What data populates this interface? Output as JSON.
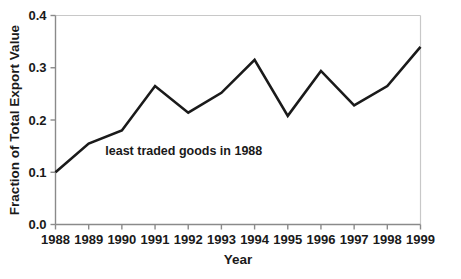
{
  "chart_data": {
    "type": "line",
    "title": "",
    "xlabel": "Year",
    "ylabel": "Fraction of Total Export Value",
    "categories": [
      "1988",
      "1989",
      "1990",
      "1991",
      "1992",
      "1993",
      "1994",
      "1995",
      "1996",
      "1997",
      "1998",
      "1999"
    ],
    "values": [
      0.1,
      0.155,
      0.18,
      0.265,
      0.214,
      0.252,
      0.315,
      0.208,
      0.294,
      0.228,
      0.265,
      0.34
    ],
    "series": [
      {
        "name": "least traded goods in 1988",
        "values": [
          0.1,
          0.155,
          0.18,
          0.265,
          0.214,
          0.252,
          0.315,
          0.208,
          0.294,
          0.228,
          0.265,
          0.34
        ]
      }
    ],
    "xlim": [
      1988,
      1999
    ],
    "ylim": [
      0.0,
      0.4
    ],
    "ytick_labels": [
      "0.0",
      "0.1",
      "0.2",
      "0.3",
      "0.4"
    ],
    "ytick_values": [
      0.0,
      0.1,
      0.2,
      0.3,
      0.4
    ],
    "xtick_labels": [
      "1988",
      "1989",
      "1990",
      "1991",
      "1992",
      "1993",
      "1994",
      "1995",
      "1996",
      "1997",
      "1998",
      "1999"
    ],
    "grid": false,
    "legend": "none",
    "annotations": [
      {
        "text": "least traded goods in 1988",
        "x": 1989.5,
        "y": 0.133
      }
    ],
    "colors": {
      "line": "#1a1a1a",
      "axis": "#808080",
      "frame": "#c8c8c8",
      "text": "#1a1a1a",
      "background": "#ffffff"
    },
    "line_width": 2.6
  }
}
